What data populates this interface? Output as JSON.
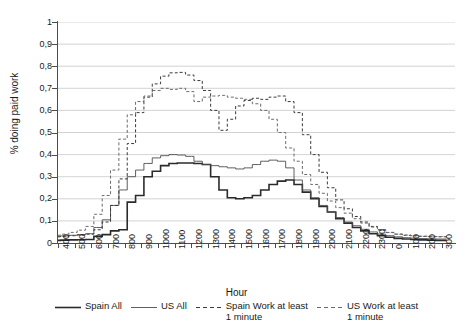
{
  "chart_data": {
    "type": "line",
    "title": "",
    "xlabel": "Hour",
    "ylabel": "% doing paid work",
    "ylim": [
      0,
      1
    ],
    "ytick_labels": [
      "1",
      "0,9",
      "0,8",
      "0,7",
      "0,6",
      "0,5",
      "0,4",
      "0,3",
      "0,2",
      "0,1",
      "0"
    ],
    "ytick_values": [
      1,
      0.9,
      0.8,
      0.7,
      0.6,
      0.5,
      0.4,
      0.3,
      0.2,
      0.1,
      0
    ],
    "xtick_labels": [
      "400",
      "500",
      "600",
      "700",
      "800",
      "900",
      "1000",
      "1100",
      "1200",
      "1300",
      "1400",
      "1500",
      "1600",
      "1700",
      "1800",
      "1900",
      "2000",
      "2100",
      "2200",
      "2300",
      "0",
      "100",
      "200",
      "300"
    ],
    "xtick_values": [
      400,
      500,
      600,
      700,
      800,
      900,
      1000,
      1100,
      1200,
      1300,
      1400,
      1500,
      1600,
      1700,
      1800,
      1900,
      2000,
      2100,
      2200,
      2300,
      2400,
      2500,
      2600,
      2700
    ],
    "xlim": [
      400,
      2780
    ],
    "grid": "horizontal",
    "legend_position": "bottom",
    "x": [
      400,
      430,
      500,
      530,
      600,
      630,
      700,
      730,
      800,
      830,
      900,
      930,
      1000,
      1030,
      1100,
      1130,
      1200,
      1230,
      1300,
      1330,
      1400,
      1430,
      1500,
      1530,
      1600,
      1630,
      1700,
      1730,
      1800,
      1830,
      1900,
      1930,
      2000,
      2030,
      2100,
      2130,
      2200,
      2230,
      2300,
      2330,
      2400,
      2430,
      2500,
      2530,
      2600,
      2630,
      2700,
      2730
    ],
    "series": [
      {
        "name": "Spain All",
        "style": "solid",
        "width": 1.6,
        "color": "#2b2b2b",
        "values": [
          0.012,
          0.013,
          0.014,
          0.015,
          0.016,
          0.03,
          0.038,
          0.055,
          0.06,
          0.185,
          0.215,
          0.3,
          0.325,
          0.35,
          0.36,
          0.362,
          0.362,
          0.36,
          0.355,
          0.3,
          0.24,
          0.205,
          0.2,
          0.205,
          0.215,
          0.24,
          0.265,
          0.28,
          0.285,
          0.265,
          0.23,
          0.2,
          0.165,
          0.14,
          0.11,
          0.09,
          0.07,
          0.055,
          0.042,
          0.033,
          0.026,
          0.021,
          0.018,
          0.016,
          0.014,
          0.013,
          0.012,
          0.012
        ]
      },
      {
        "name": "US All",
        "style": "solid",
        "width": 0.9,
        "color": "#4d4d4d",
        "values": [
          0.03,
          0.032,
          0.035,
          0.038,
          0.042,
          0.07,
          0.105,
          0.17,
          0.24,
          0.3,
          0.33,
          0.36,
          0.385,
          0.395,
          0.4,
          0.398,
          0.392,
          0.37,
          0.355,
          0.35,
          0.345,
          0.34,
          0.335,
          0.34,
          0.355,
          0.37,
          0.375,
          0.37,
          0.34,
          0.285,
          0.24,
          0.205,
          0.17,
          0.14,
          0.115,
          0.095,
          0.078,
          0.062,
          0.05,
          0.04,
          0.033,
          0.028,
          0.024,
          0.022,
          0.02,
          0.019,
          0.018,
          0.018
        ]
      },
      {
        "name": "Spain Work at least\n1 minute",
        "style": "dashed",
        "width": 1.0,
        "color": "#3a3a3a",
        "values": [
          0.028,
          0.03,
          0.033,
          0.036,
          0.04,
          0.06,
          0.095,
          0.17,
          0.29,
          0.45,
          0.59,
          0.66,
          0.72,
          0.755,
          0.77,
          0.772,
          0.76,
          0.735,
          0.69,
          0.6,
          0.51,
          0.56,
          0.62,
          0.645,
          0.655,
          0.65,
          0.66,
          0.665,
          0.64,
          0.59,
          0.49,
          0.4,
          0.32,
          0.25,
          0.195,
          0.155,
          0.12,
          0.095,
          0.075,
          0.06,
          0.048,
          0.04,
          0.035,
          0.032,
          0.03,
          0.029,
          0.028,
          0.028
        ]
      },
      {
        "name": "US Work at least\n1 minute",
        "style": "dashed",
        "width": 1.0,
        "color": "#6a6a6a",
        "values": [
          0.035,
          0.04,
          0.048,
          0.058,
          0.075,
          0.13,
          0.215,
          0.33,
          0.47,
          0.58,
          0.64,
          0.665,
          0.69,
          0.7,
          0.695,
          0.7,
          0.685,
          0.64,
          0.66,
          0.665,
          0.668,
          0.66,
          0.655,
          0.65,
          0.63,
          0.6,
          0.56,
          0.5,
          0.43,
          0.37,
          0.31,
          0.265,
          0.225,
          0.19,
          0.16,
          0.135,
          0.11,
          0.09,
          0.072,
          0.058,
          0.047,
          0.04,
          0.036,
          0.033,
          0.031,
          0.03,
          0.029,
          0.029
        ]
      }
    ]
  },
  "legend": {
    "items": [
      {
        "label": "Spain All",
        "style": "solid"
      },
      {
        "label": "US All",
        "style": "solid"
      },
      {
        "label": "Spain Work at least\n1 minute",
        "style": "dashed"
      },
      {
        "label": "US Work at least\n1 minute",
        "style": "dashed"
      }
    ]
  }
}
